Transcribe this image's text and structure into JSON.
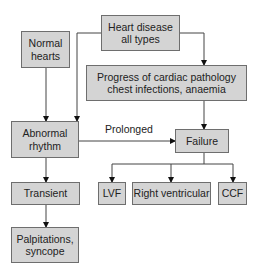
{
  "diagram": {
    "nodes": {
      "heart_disease": "Heart disease\nall types",
      "normal_hearts": "Normal\nhearts",
      "progress": "Progress of cardiac pathology\nchest infections, anaemia",
      "abnormal_rhythm": "Abnormal\nrhythm",
      "failure": "Failure",
      "transient": "Transient",
      "lvf": "LVF",
      "right_ventricular": "Right ventricular",
      "ccf": "CCF",
      "palpitations": "Palpitations,\nsyncope"
    },
    "edge_labels": {
      "prolonged": "Prolonged"
    },
    "edges": [
      {
        "from": "heart_disease",
        "to": "abnormal_rhythm"
      },
      {
        "from": "heart_disease",
        "to": "progress"
      },
      {
        "from": "normal_hearts",
        "to": "abnormal_rhythm"
      },
      {
        "from": "progress",
        "to": "failure"
      },
      {
        "from": "abnormal_rhythm",
        "to": "failure",
        "label": "Prolonged"
      },
      {
        "from": "abnormal_rhythm",
        "to": "transient"
      },
      {
        "from": "transient",
        "to": "palpitations"
      },
      {
        "from": "failure",
        "to": "lvf"
      },
      {
        "from": "failure",
        "to": "right_ventricular"
      },
      {
        "from": "failure",
        "to": "ccf"
      }
    ],
    "colors": {
      "box_fill": "#d4d4d4",
      "box_border": "#6e6e6e",
      "line": "#333333"
    }
  }
}
